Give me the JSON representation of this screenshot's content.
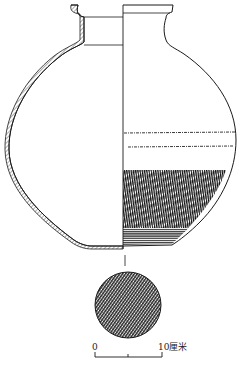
{
  "figure": {
    "type": "archaeological line drawing of a ceramic jar",
    "vessel_number": "1",
    "scale_bar": {
      "start_label": "0",
      "end_label": "10厘米"
    },
    "colors": {
      "ink": "#1a1a1a",
      "paper": "#ffffff"
    }
  }
}
